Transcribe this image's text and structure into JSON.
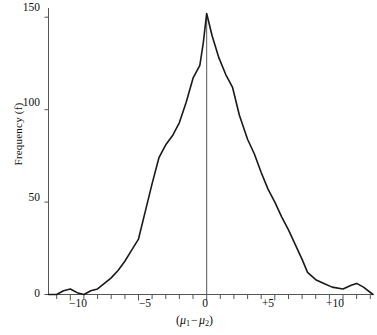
{
  "chart_data": {
    "type": "line",
    "title": "",
    "subtitle": "",
    "xlabel": "(μ₁ − μ₂)",
    "ylabel": "Frequency (f)",
    "xlim": [
      -11.6,
      12.2
    ],
    "ylim": [
      0,
      155
    ],
    "grid": false,
    "legend": null,
    "x_ticks_major": [
      -10,
      -5,
      0,
      5,
      10
    ],
    "x_tick_labels": [
      "−10",
      "−5",
      "0",
      "+5",
      "+10"
    ],
    "x_ticks_minor_step": 1,
    "y_ticks": [
      0,
      50,
      100,
      150
    ],
    "y_tick_labels": [
      "0",
      "50",
      "100",
      "150"
    ],
    "reference_line_x": 0,
    "line_color": "#1a1a1a",
    "axis_color": "#555555",
    "background_color": "#ffffff",
    "series": [
      {
        "name": "Frequency",
        "x": [
          -11.6,
          -11.0,
          -10.5,
          -10.0,
          -9.5,
          -9.0,
          -8.5,
          -8.0,
          -7.5,
          -7.0,
          -6.5,
          -6.0,
          -5.5,
          -5.0,
          -4.5,
          -4.0,
          -3.5,
          -3.0,
          -2.5,
          -2.0,
          -1.5,
          -1.0,
          -0.5,
          -0.25,
          0.0,
          0.4,
          0.9,
          1.4,
          1.9,
          2.4,
          3.0,
          3.5,
          4.0,
          4.5,
          5.0,
          5.5,
          6.0,
          6.5,
          7.0,
          7.4,
          8.0,
          8.6,
          9.2,
          10.0,
          10.6,
          11.0,
          11.5,
          12.2
        ],
        "y": [
          0,
          0,
          2,
          3,
          1,
          0,
          2,
          3,
          6,
          9,
          13,
          18,
          24,
          30,
          45,
          60,
          74,
          81,
          86,
          93,
          104,
          117,
          124,
          136,
          152,
          140,
          128,
          119,
          112,
          97,
          84,
          76,
          66,
          57,
          50,
          42,
          35,
          27,
          19,
          12,
          8,
          6,
          4,
          3,
          5,
          6,
          4,
          0
        ]
      }
    ]
  },
  "axes": {
    "y_label_text": "Frequency (f)",
    "y_tick_0": "0",
    "y_tick_50": "50",
    "y_tick_100": "100",
    "y_tick_150": "150",
    "x_tick_neg10": "−10",
    "x_tick_neg5": "−5",
    "x_tick_0": "0",
    "x_tick_pos5": "+5",
    "x_tick_pos10": "+10",
    "x_label_open": "(",
    "x_label_mu1": "μ",
    "x_label_sub1": "1",
    "x_label_minus": "−",
    "x_label_mu2": "μ",
    "x_label_sub2": "2",
    "x_label_close": ")"
  }
}
